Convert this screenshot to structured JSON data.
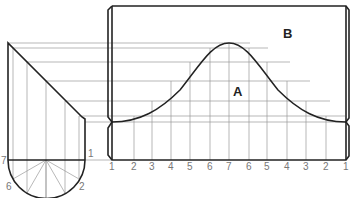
{
  "figure": {
    "type": "cylinder-development-diagram",
    "regions": {
      "a": "A",
      "b": "B"
    },
    "cylinder_labels": {
      "top_right": "1",
      "left": "7",
      "lower_left": "6",
      "lower_right": "2"
    },
    "pattern_labels": [
      "1",
      "2",
      "3",
      "4",
      "5",
      "6",
      "7",
      "6",
      "5",
      "4",
      "3",
      "2",
      "1"
    ],
    "colors": {
      "outline": "#222222",
      "construction": "#9a9a9a",
      "text": "#777777"
    }
  }
}
